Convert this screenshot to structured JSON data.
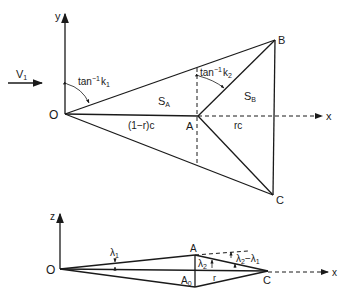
{
  "top_view": {
    "axes": {
      "x_label": "x",
      "y_label": "y"
    },
    "points": {
      "O": "O",
      "A": "A",
      "B": "B",
      "C": "C"
    },
    "flow_label": "V",
    "flow_sub": "1",
    "angle1": {
      "base": "tan",
      "sup": "−1",
      "var": "k",
      "sub": "1"
    },
    "angle2": {
      "base": "tan",
      "sup": "−1",
      "var": "k",
      "sub": "2"
    },
    "region_a": {
      "base": "S",
      "sub": "A"
    },
    "region_b": {
      "base": "S",
      "sub": "B"
    },
    "segment_oa": "(1−r)c",
    "segment_ac": "rc"
  },
  "side_view": {
    "axes": {
      "x_label": "x",
      "z_label": "z"
    },
    "points": {
      "O": "O",
      "A": "A",
      "A0": "A",
      "A0_sub": "0",
      "C": "C"
    },
    "lambda1": {
      "base": "λ",
      "sub": "1"
    },
    "lambda2": {
      "base": "λ",
      "sub": "2"
    },
    "lambda_diff": {
      "a": "λ",
      "a_sub": "2",
      "op": "−",
      "b": "λ",
      "b_sub": "1"
    },
    "segment_r": "r"
  }
}
